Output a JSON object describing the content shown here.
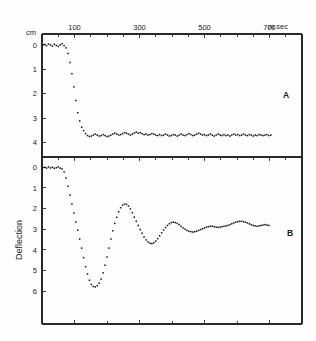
{
  "figure": {
    "background_color": "#fefefe",
    "ink_color": "#1a1a1a",
    "x_unit_label": "m sec",
    "y_unit_label_top": "cm",
    "y_axis_title_bottom": "Deflection",
    "panel_a_letter": "A",
    "panel_b_letter": "B"
  },
  "axis": {
    "x_tick_labels": [
      "100",
      "300",
      "500",
      "700"
    ],
    "x_tick_values": [
      100,
      300,
      500,
      700
    ],
    "x_minor_tick_values": [
      0,
      200,
      400,
      600,
      800
    ],
    "y_tick_labels_a": [
      "0",
      "1",
      "2",
      "3",
      "4"
    ],
    "y_tick_labels_b": [
      "0",
      "1",
      "2",
      "3",
      "4",
      "5",
      "6"
    ]
  },
  "chart_data": [
    {
      "type": "scatter",
      "title": "",
      "panel": "A",
      "xlabel": "m sec",
      "ylabel": "cm",
      "xlim": [
        0,
        800
      ],
      "ylim": [
        4.6,
        -0.45
      ],
      "y_inverted": true,
      "grid": false,
      "legend": "none",
      "annotation": "A",
      "series": [
        {
          "name": "overdamped-step-response",
          "x": [
            2,
            8,
            14,
            20,
            26,
            32,
            38,
            44,
            50,
            56,
            62,
            68,
            74,
            80,
            86,
            92,
            98,
            104,
            110,
            116,
            122,
            128,
            134,
            140,
            146,
            152,
            158,
            164,
            170,
            176,
            182,
            188,
            194,
            200,
            206,
            212,
            218,
            224,
            230,
            236,
            242,
            248,
            254,
            260,
            266,
            272,
            278,
            284,
            290,
            296,
            302,
            308,
            314,
            320,
            326,
            332,
            338,
            344,
            350,
            356,
            362,
            368,
            374,
            380,
            386,
            392,
            398,
            404,
            410,
            416,
            422,
            428,
            434,
            440,
            446,
            452,
            458,
            464,
            470,
            476,
            482,
            488,
            494,
            500,
            506,
            512,
            518,
            524,
            530,
            536,
            542,
            548,
            554,
            560,
            566,
            572,
            578,
            584,
            590,
            596,
            602,
            608,
            614,
            620,
            626,
            632,
            638,
            644,
            650,
            656,
            662,
            668,
            674,
            680,
            686,
            692,
            698,
            704
          ],
          "y": [
            0.02,
            -0.02,
            0.03,
            -0.04,
            0.0,
            0.05,
            -0.03,
            0.02,
            0.06,
            0.0,
            -0.05,
            0.03,
            0.12,
            0.35,
            0.72,
            1.18,
            1.72,
            2.28,
            2.78,
            3.12,
            3.38,
            3.52,
            3.64,
            3.72,
            3.76,
            3.74,
            3.7,
            3.66,
            3.7,
            3.74,
            3.72,
            3.68,
            3.72,
            3.76,
            3.74,
            3.7,
            3.66,
            3.62,
            3.66,
            3.7,
            3.68,
            3.64,
            3.6,
            3.62,
            3.66,
            3.7,
            3.66,
            3.62,
            3.58,
            3.62,
            3.6,
            3.64,
            3.68,
            3.66,
            3.7,
            3.68,
            3.64,
            3.66,
            3.7,
            3.72,
            3.68,
            3.72,
            3.7,
            3.66,
            3.7,
            3.74,
            3.72,
            3.68,
            3.7,
            3.74,
            3.7,
            3.66,
            3.7,
            3.72,
            3.68,
            3.64,
            3.68,
            3.72,
            3.7,
            3.66,
            3.62,
            3.66,
            3.7,
            3.68,
            3.72,
            3.7,
            3.66,
            3.7,
            3.74,
            3.7,
            3.66,
            3.7,
            3.72,
            3.68,
            3.72,
            3.7,
            3.74,
            3.7,
            3.66,
            3.7,
            3.68,
            3.72,
            3.7,
            3.66,
            3.7,
            3.72,
            3.68,
            3.7,
            3.74,
            3.7,
            3.72,
            3.68,
            3.7,
            3.72,
            3.7,
            3.68,
            3.72,
            3.7
          ]
        }
      ]
    },
    {
      "type": "scatter",
      "title": "",
      "panel": "B",
      "xlabel": "m sec",
      "ylabel": "Deflection",
      "xlim": [
        0,
        800
      ],
      "ylim": [
        7.6,
        -0.5
      ],
      "y_inverted": true,
      "grid": false,
      "legend": "none",
      "annotation": "B",
      "series": [
        {
          "name": "underdamped-step-response",
          "x": [
            2,
            8,
            14,
            20,
            26,
            32,
            38,
            44,
            50,
            56,
            62,
            68,
            74,
            80,
            86,
            92,
            98,
            104,
            110,
            116,
            122,
            128,
            134,
            140,
            146,
            152,
            158,
            164,
            170,
            176,
            182,
            188,
            194,
            200,
            206,
            212,
            218,
            224,
            230,
            236,
            242,
            248,
            254,
            260,
            266,
            272,
            278,
            284,
            290,
            296,
            302,
            308,
            314,
            320,
            326,
            332,
            338,
            344,
            350,
            356,
            362,
            368,
            374,
            380,
            386,
            392,
            398,
            404,
            410,
            416,
            422,
            428,
            434,
            440,
            446,
            452,
            458,
            464,
            470,
            476,
            482,
            488,
            494,
            500,
            506,
            512,
            518,
            524,
            530,
            536,
            542,
            548,
            554,
            560,
            566,
            572,
            578,
            584,
            590,
            596,
            602,
            608,
            614,
            620,
            626,
            632,
            638,
            644,
            650,
            656,
            662,
            668,
            674,
            680,
            686,
            692,
            698
          ],
          "y": [
            0.02,
            0.0,
            0.04,
            -0.02,
            0.03,
            0.0,
            0.05,
            0.02,
            -0.02,
            0.04,
            0.08,
            0.22,
            0.52,
            0.92,
            1.35,
            1.78,
            2.22,
            2.65,
            3.05,
            3.48,
            3.92,
            4.38,
            4.82,
            5.18,
            5.48,
            5.68,
            5.78,
            5.8,
            5.74,
            5.62,
            5.42,
            5.12,
            4.75,
            4.35,
            3.92,
            3.48,
            3.08,
            2.72,
            2.42,
            2.15,
            1.96,
            1.84,
            1.78,
            1.8,
            1.88,
            2.02,
            2.2,
            2.42,
            2.62,
            2.82,
            3.02,
            3.2,
            3.38,
            3.52,
            3.62,
            3.68,
            3.7,
            3.66,
            3.58,
            3.46,
            3.32,
            3.18,
            3.04,
            2.92,
            2.82,
            2.74,
            2.68,
            2.66,
            2.68,
            2.72,
            2.78,
            2.86,
            2.94,
            3.0,
            3.06,
            3.1,
            3.12,
            3.14,
            3.12,
            3.1,
            3.06,
            3.02,
            2.98,
            2.94,
            2.9,
            2.88,
            2.86,
            2.86,
            2.88,
            2.9,
            2.92,
            2.9,
            2.88,
            2.86,
            2.84,
            2.82,
            2.78,
            2.74,
            2.7,
            2.66,
            2.64,
            2.62,
            2.62,
            2.64,
            2.66,
            2.7,
            2.74,
            2.78,
            2.82,
            2.84,
            2.86,
            2.84,
            2.82,
            2.8,
            2.78,
            2.8,
            2.82,
            2.84,
            2.86
          ]
        }
      ]
    }
  ]
}
